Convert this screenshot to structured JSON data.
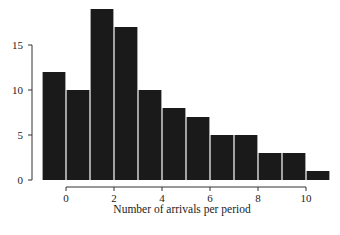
{
  "chart_data": {
    "type": "bar",
    "title": "",
    "xlabel": "Number of arrivals per period",
    "ylabel": "",
    "bins": [
      [
        -1,
        0
      ],
      [
        0,
        1
      ],
      [
        1,
        2
      ],
      [
        2,
        3
      ],
      [
        3,
        4
      ],
      [
        4,
        5
      ],
      [
        5,
        6
      ],
      [
        6,
        7
      ],
      [
        7,
        8
      ],
      [
        8,
        9
      ],
      [
        9,
        10
      ],
      [
        10,
        11
      ]
    ],
    "categories": [
      "-1–0",
      "0–1",
      "1–2",
      "2–3",
      "3–4",
      "4–5",
      "5–6",
      "6–7",
      "7–8",
      "8–9",
      "9–10",
      "10–11"
    ],
    "values": [
      12,
      10,
      19,
      17,
      10,
      8,
      7,
      5,
      5,
      3,
      3,
      1
    ],
    "xticks": [
      0,
      2,
      4,
      6,
      8,
      10
    ],
    "yticks": [
      0,
      5,
      10,
      15
    ],
    "xlim": [
      -1,
      11
    ],
    "ylim": [
      0,
      19
    ],
    "grid": false,
    "legend": null,
    "bar_color": "#1a1a1a"
  }
}
